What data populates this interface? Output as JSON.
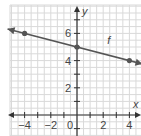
{
  "chart_data": {
    "type": "line",
    "title": "",
    "xlabel": "x",
    "ylabel": "y",
    "xlim": [
      -5,
      5
    ],
    "ylim": [
      -1,
      8
    ],
    "grid": true,
    "x_ticks": [
      -4,
      -2,
      0,
      2,
      4
    ],
    "x_tick_labels": [
      "−4",
      "−2",
      "0",
      "2",
      "4"
    ],
    "y_ticks": [
      2,
      4,
      6
    ],
    "y_tick_labels": [
      "2",
      "4",
      "6"
    ],
    "series": [
      {
        "name": "f",
        "equation": "y = -0.25x + 5",
        "points": [
          {
            "x": -4,
            "y": 6
          },
          {
            "x": 0,
            "y": 5
          },
          {
            "x": 4,
            "y": 4
          }
        ],
        "extends_both_directions": true
      }
    ],
    "annotations": [
      {
        "text": "f",
        "x": 2.3,
        "y": 5.2
      }
    ]
  },
  "colors": {
    "grid": "#d9d9d9",
    "axis": "#333333",
    "line": "#555555",
    "point": "#555555",
    "text": "#444444"
  }
}
